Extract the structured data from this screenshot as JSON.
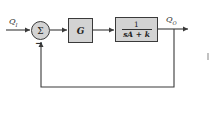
{
  "diagram": {
    "type": "block-diagram",
    "input_label": {
      "main": "Q",
      "sub": "I"
    },
    "output_label": {
      "main": "Q",
      "sub": "O"
    },
    "summing_junction": {
      "symbol": "Σ",
      "feedback_sign": "−"
    },
    "blocks": [
      {
        "id": "controller",
        "label": "G"
      },
      {
        "id": "plant",
        "numerator": "1",
        "denominator": "sA + k"
      }
    ],
    "feedback": "unity negative feedback",
    "colors": {
      "block_fill": "#d3d3d3",
      "stroke": "#3a3a3a",
      "background": "#ffffff"
    }
  }
}
